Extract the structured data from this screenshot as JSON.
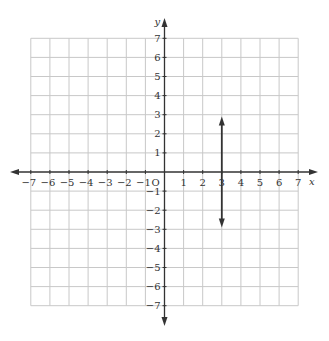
{
  "chart_data": {
    "type": "line",
    "title": "",
    "xlabel": "x",
    "ylabel": "y",
    "origin_label": "O",
    "xlim": [
      -7,
      7
    ],
    "ylim": [
      -7,
      7
    ],
    "grid": true,
    "x_ticks": [
      -7,
      -6,
      -5,
      -4,
      -3,
      -2,
      -1,
      1,
      2,
      3,
      4,
      5,
      6,
      7
    ],
    "y_ticks": [
      -7,
      -6,
      -5,
      -4,
      -3,
      -2,
      -1,
      1,
      2,
      3,
      4,
      5,
      6,
      7
    ],
    "x_tick_labels": [
      "−7",
      "−6",
      "−5",
      "−4",
      "−3",
      "−2",
      "−1",
      "1",
      "2",
      "3",
      "4",
      "5",
      "6",
      "7"
    ],
    "y_tick_labels": [
      "7",
      "6",
      "5",
      "4",
      "3",
      "2",
      "1",
      "−1",
      "−2",
      "−3",
      "−4",
      "−5",
      "−6",
      "−7"
    ],
    "series": [
      {
        "name": "vertical line x = 3",
        "kind": "line-with-arrows-both-ends",
        "x": [
          3,
          3
        ],
        "y": [
          2.9,
          -2.9
        ]
      }
    ],
    "legend": null
  },
  "colors": {
    "grid": "#c8c8c8",
    "axis": "#333333",
    "line": "#333333"
  }
}
